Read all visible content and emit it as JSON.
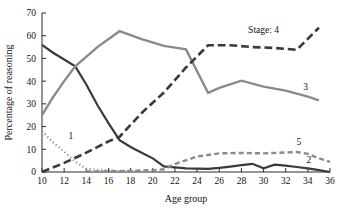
{
  "chart_data": {
    "type": "line",
    "title": "",
    "xlabel": "Age group",
    "ylabel": "Percentage of reasoning",
    "xlim": [
      10,
      36
    ],
    "ylim": [
      0,
      70
    ],
    "xticks": [
      10,
      12,
      14,
      16,
      18,
      20,
      22,
      24,
      26,
      28,
      30,
      32,
      34,
      36
    ],
    "yticks": [
      0,
      10,
      20,
      30,
      40,
      50,
      60,
      70
    ],
    "grid": false,
    "legend_position": "inline-right-end-labels",
    "legend_prefix": "Stage:",
    "series": [
      {
        "name": "1",
        "label": "1",
        "color": "#8a8a8a",
        "style": "dotted",
        "width": 2.2,
        "x": [
          10,
          11,
          12,
          13,
          14,
          15,
          16,
          17,
          18,
          19,
          20,
          21
        ],
        "values": [
          18.0,
          13.0,
          9.0,
          4.5,
          1.4,
          1.0,
          0.8,
          0.5,
          0.4,
          0.3,
          0.2,
          0.0
        ]
      },
      {
        "name": "2",
        "label": "2",
        "color": "#3a3a3a",
        "style": "solid",
        "width": 2.2,
        "x": [
          10,
          11,
          12,
          13,
          14,
          15,
          16,
          17,
          18,
          19,
          20,
          21,
          22,
          23,
          24,
          25,
          26,
          27,
          28,
          29,
          30,
          31,
          32,
          33,
          34,
          35,
          36
        ],
        "values": [
          56.0,
          52.5,
          49.5,
          46.5,
          38.5,
          29.5,
          21.5,
          14.0,
          11.0,
          8.5,
          6.0,
          2.5,
          2.0,
          1.6,
          1.5,
          1.4,
          1.8,
          2.4,
          3.0,
          3.6,
          1.6,
          3.2,
          2.8,
          2.2,
          1.6,
          0.8,
          0.0
        ]
      },
      {
        "name": "3",
        "label": "3",
        "color": "#8a8a8a",
        "style": "solid",
        "width": 2.4,
        "x": [
          10,
          11,
          12,
          13,
          15,
          17,
          19,
          21,
          23,
          25,
          26,
          28,
          30,
          32,
          34,
          35
        ],
        "values": [
          25.0,
          33.0,
          40.0,
          46.5,
          55.0,
          62.0,
          58.5,
          55.5,
          54.0,
          34.8,
          37.0,
          40.2,
          37.6,
          35.8,
          33.2,
          31.5
        ]
      },
      {
        "name": "4",
        "label": "Stage: 4",
        "color": "#3a3a3a",
        "style": "dashed-long",
        "width": 2.6,
        "x": [
          10,
          12,
          14,
          16,
          17,
          19,
          21,
          23,
          25,
          27,
          29,
          31,
          33,
          35
        ],
        "values": [
          0.0,
          4.0,
          8.5,
          13.5,
          15.5,
          26.0,
          35.0,
          46.0,
          55.8,
          55.8,
          55.0,
          54.6,
          53.8,
          63.5
        ]
      },
      {
        "name": "5",
        "label": "5",
        "color": "#8a8a8a",
        "style": "dashed-short",
        "width": 2.4,
        "x": [
          14,
          16,
          18,
          20,
          21,
          22,
          24,
          26,
          28,
          30,
          32,
          33,
          34,
          35,
          36
        ],
        "values": [
          0.2,
          0.3,
          0.5,
          0.8,
          1.2,
          3.5,
          6.8,
          8.2,
          8.4,
          8.2,
          8.6,
          8.8,
          8.0,
          6.0,
          4.5
        ]
      }
    ],
    "annotations": [
      {
        "text": "1",
        "x": 12.6,
        "y": 14.5,
        "name": "series-label-1"
      },
      {
        "text": "2",
        "x": 34.1,
        "y": 4.0,
        "name": "series-label-2"
      },
      {
        "text": "3",
        "x": 33.8,
        "y": 36.0,
        "name": "series-label-3"
      },
      {
        "text": "Stage: 4",
        "x": 30.0,
        "y": 61.0,
        "name": "series-label-4"
      },
      {
        "text": "5",
        "x": 33.2,
        "y": 12.0,
        "name": "series-label-5"
      }
    ]
  }
}
